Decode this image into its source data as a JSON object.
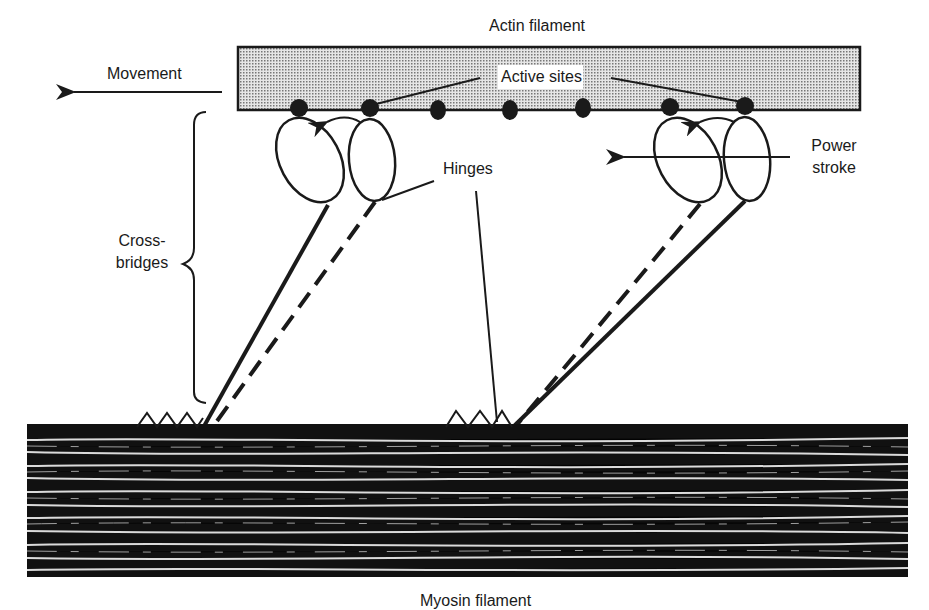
{
  "diagram": {
    "type": "sliding-filament cross-bridge mechanism",
    "labels": {
      "actin": "Actin filament",
      "active_sites": "Active sites",
      "movement": "Movement",
      "hinges": "Hinges",
      "power_line1": "Power",
      "power_line2": "stroke",
      "cross_line1": "Cross-",
      "cross_line2": "bridges",
      "myosin": "Myosin filament"
    },
    "active_site_count": 7,
    "cross_bridge_pairs": 2,
    "colors": {
      "ink": "#1a1a1a",
      "actin_fill": "#c8c8c8",
      "background": "#ffffff"
    }
  }
}
